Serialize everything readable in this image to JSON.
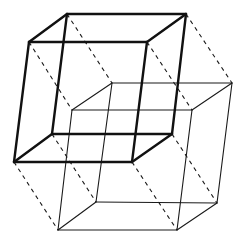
{
  "diagram": {
    "title": "",
    "colors": {
      "background": "#ffffff",
      "bold_stroke": "#111111",
      "thin_stroke": "#1a1a1a",
      "dash_stroke": "#1a1a1a"
    },
    "bold_cube": {
      "vertices": {
        "A": [
          29,
          42
        ],
        "B": [
          147,
          42
        ],
        "C": [
          132,
          162
        ],
        "D": [
          14,
          162
        ],
        "E": [
          67,
          14
        ],
        "F": [
          186,
          14
        ],
        "G": [
          172,
          134
        ],
        "H": [
          52,
          134
        ]
      },
      "edges": [
        [
          "A",
          "B"
        ],
        [
          "B",
          "C"
        ],
        [
          "C",
          "D"
        ],
        [
          "D",
          "A"
        ],
        [
          "E",
          "F"
        ],
        [
          "F",
          "G"
        ],
        [
          "G",
          "H"
        ],
        [
          "H",
          "E"
        ],
        [
          "A",
          "E"
        ],
        [
          "B",
          "F"
        ],
        [
          "C",
          "G"
        ],
        [
          "D",
          "H"
        ]
      ]
    },
    "thin_cube": {
      "vertices": {
        "A": [
          72,
          110
        ],
        "B": [
          192,
          110
        ],
        "C": [
          177,
          230
        ],
        "D": [
          58,
          230
        ],
        "E": [
          112,
          83
        ],
        "F": [
          232,
          83
        ],
        "G": [
          217,
          203
        ],
        "H": [
          96,
          202
        ]
      },
      "edges": [
        [
          "A",
          "B"
        ],
        [
          "B",
          "C"
        ],
        [
          "C",
          "D"
        ],
        [
          "D",
          "A"
        ],
        [
          "E",
          "F"
        ],
        [
          "F",
          "G"
        ],
        [
          "G",
          "H"
        ],
        [
          "H",
          "E"
        ],
        [
          "A",
          "E"
        ],
        [
          "B",
          "F"
        ],
        [
          "C",
          "G"
        ],
        [
          "D",
          "H"
        ]
      ]
    },
    "connectors": [
      [
        "A",
        "A"
      ],
      [
        "B",
        "B"
      ],
      [
        "C",
        "C"
      ],
      [
        "D",
        "D"
      ],
      [
        "E",
        "E"
      ],
      [
        "F",
        "F"
      ],
      [
        "G",
        "G"
      ],
      [
        "H",
        "H"
      ]
    ]
  }
}
